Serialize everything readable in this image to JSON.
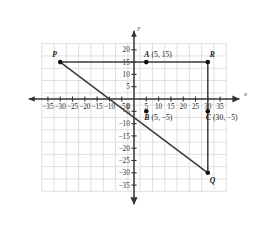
{
  "chart_data": {
    "type": "scatter",
    "title": "",
    "xlabel": "x",
    "ylabel": "y",
    "xlim": [
      -37.5,
      37.5
    ],
    "ylim": [
      -37.5,
      22.5
    ],
    "grid": true,
    "grid_step": 5,
    "legend": "none",
    "x_ticks": [
      "-35",
      "-30",
      "-25",
      "-20",
      "-15",
      "-10",
      "-5",
      "0",
      "5",
      "10",
      "15",
      "20",
      "25",
      "30",
      "35"
    ],
    "x_tick_values": [
      -35,
      -30,
      -25,
      -20,
      -15,
      -10,
      -5,
      0,
      5,
      10,
      15,
      20,
      25,
      30,
      35
    ],
    "y_ticks": [
      "20",
      "15",
      "10",
      "5",
      "0",
      "-5",
      "-10",
      "-15",
      "-20",
      "-25",
      "-30",
      "-35"
    ],
    "y_tick_values": [
      20,
      15,
      10,
      5,
      0,
      -5,
      -10,
      -15,
      -20,
      -25,
      -30,
      -35
    ],
    "points": [
      {
        "name": "P",
        "label": "P",
        "coord_text": "",
        "x": -30,
        "y": 15,
        "label_dx": -8,
        "label_dy": -5
      },
      {
        "name": "R",
        "label": "R",
        "coord_text": "",
        "x": 30,
        "y": 15,
        "label_dx": 2,
        "label_dy": -5
      },
      {
        "name": "Q",
        "label": "Q",
        "coord_text": "",
        "x": 30,
        "y": -30,
        "label_dx": 2,
        "label_dy": 10
      },
      {
        "name": "A",
        "label": "A",
        "coord_text": "(5, 15)",
        "x": 5,
        "y": 15,
        "label_dx": -2,
        "label_dy": -5
      },
      {
        "name": "B",
        "label": "B",
        "coord_text": "(5, −5)",
        "x": 5,
        "y": -5,
        "label_dx": -2,
        "label_dy": 9
      },
      {
        "name": "C",
        "label": "C",
        "coord_text": "(30, −5)",
        "x": 30,
        "y": -5,
        "label_dx": -2,
        "label_dy": 9
      }
    ],
    "segments": [
      {
        "name": "segment-P-R",
        "x1": -30,
        "y1": 15,
        "x2": 30,
        "y2": 15
      },
      {
        "name": "segment-R-Q",
        "x1": 30,
        "y1": 15,
        "x2": 30,
        "y2": -30
      },
      {
        "name": "segment-P-Q",
        "x1": -30,
        "y1": 15,
        "x2": 30,
        "y2": -30
      }
    ],
    "colors": {
      "grid": "#d8d8d8",
      "axis": "#333333",
      "segment": "#3a3a3a",
      "point": "#111111",
      "background": "#ffffff"
    }
  }
}
